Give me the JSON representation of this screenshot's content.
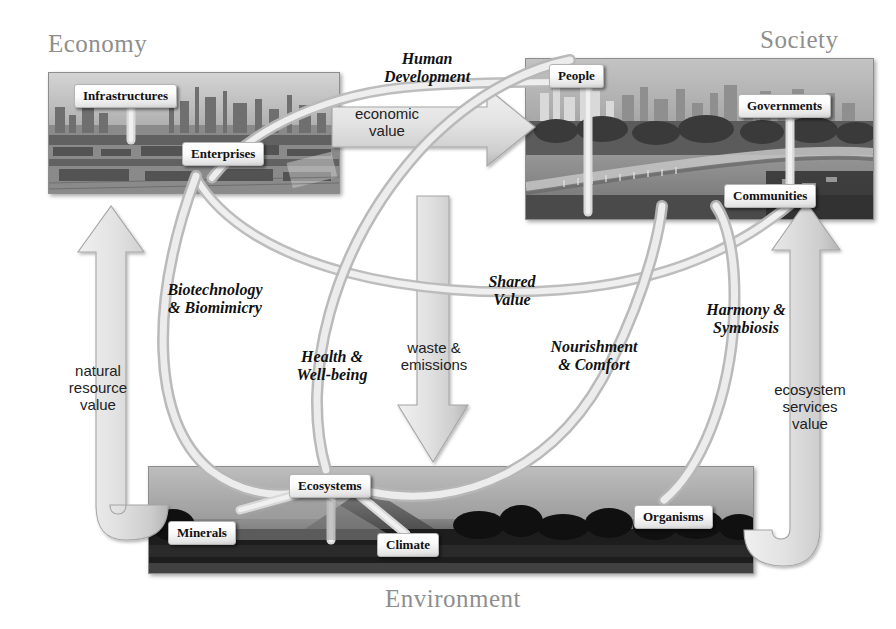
{
  "diagram": {
    "title_economy": "Economy",
    "title_society": "Society",
    "title_environment": "Environment"
  },
  "nodes": {
    "infrastructures": "Infrastructures",
    "enterprises": "Enterprises",
    "people": "People",
    "governments": "Governments",
    "communities": "Communities",
    "ecosystems": "Ecosystems",
    "minerals": "Minerals",
    "climate": "Climate",
    "organisms": "Organisms"
  },
  "flows": {
    "human_development": "Human\nDevelopment",
    "economic_value": "economic\nvalue",
    "biotechnology": "Biotechnology\n& Biomimicry",
    "health_wellbeing": "Health &\nWell-being",
    "shared_value": "Shared\nValue",
    "waste_emissions": "waste &\nemissions",
    "nourishment_comfort": "Nourishment\n& Comfort",
    "harmony_symbiosis": "Harmony &\nSymbiosis",
    "natural_resource_value": "natural\nresource\nvalue",
    "ecosystem_services_value": "ecosystem\nservices\nvalue"
  },
  "colors": {
    "title_grey": "#8e8e8e",
    "ribbon": "#e3e3e3",
    "ribbon_edge": "#9a9a9a",
    "arrow_fill": "#dcdcdc",
    "arrow_edge": "#a8a8a8",
    "box_text": "#111111"
  }
}
